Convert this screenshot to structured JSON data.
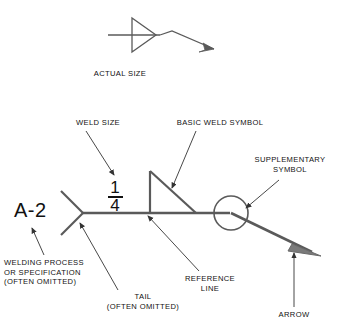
{
  "figure": {
    "title_caption": "ACTUAL SIZE",
    "tail_text": "A-2",
    "weld_size": {
      "numerator": "1",
      "denominator": "4"
    }
  },
  "labels": {
    "actual_size": "ACTUAL SIZE",
    "weld_size": "WELD SIZE",
    "basic_weld_symbol": "BASIC WELD SYMBOL",
    "supplementary_symbol": "SUPPLEMENTARY\nSYMBOL",
    "welding_process": "WELDING PROCESS\nOR SPECIFICATION\n(OFTEN OMITTED)",
    "tail": "TAIL\n(OFTEN OMITTED)",
    "reference_line": "REFERENCE\nLINE",
    "arrow": "ARROW"
  },
  "colors": {
    "line": "#5a5a5a",
    "text": "#111111",
    "background": "#ffffff"
  }
}
